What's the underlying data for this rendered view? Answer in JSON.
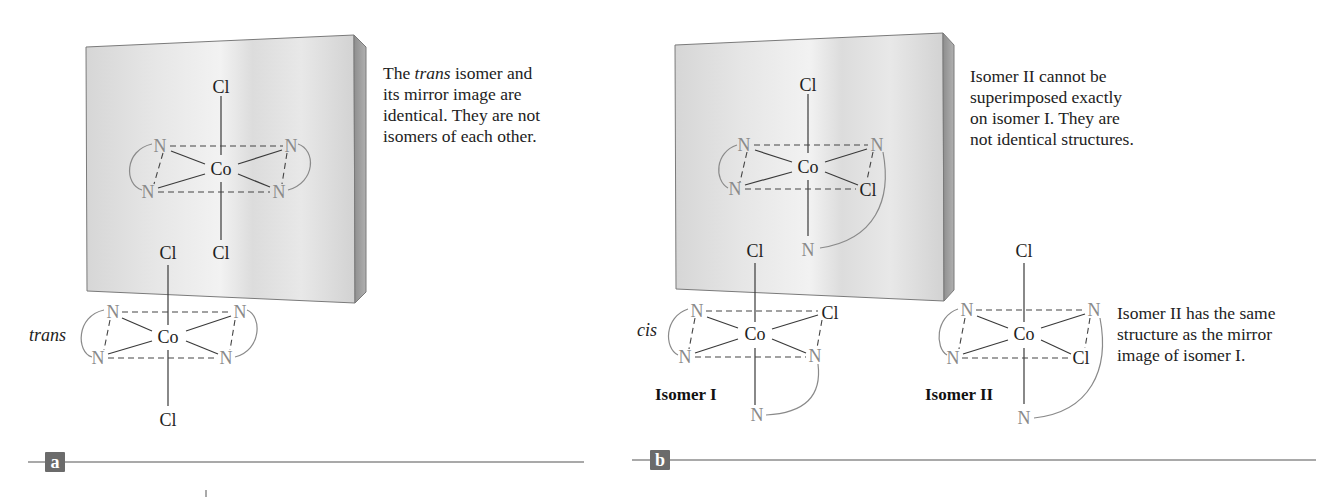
{
  "figure": {
    "panels": [
      {
        "id": "a",
        "label": "a",
        "caption_parts": [
          "The ",
          "trans",
          " isomer and its mirror image are identical. They are not isomers of each other."
        ],
        "caption_lines": [
          [
            "The ",
            "trans",
            " isomer and"
          ],
          [
            "its mirror image are"
          ],
          [
            "identical. They are not"
          ],
          [
            "isomers of each other."
          ]
        ],
        "isomer_tag": "trans",
        "molecule_atoms": {
          "metal": "Co",
          "axial_top": "Cl",
          "axial_bottom": "Cl",
          "equatorial": [
            "N",
            "N",
            "N",
            "N"
          ]
        }
      },
      {
        "id": "b",
        "label": "b",
        "caption_lines": [
          "Isomer II cannot be",
          "superimposed exactly",
          "on isomer I. They are",
          "not identical structures."
        ],
        "caption2_lines": [
          "Isomer II has the same",
          "structure as the mirror",
          "image of isomer I."
        ],
        "isomer_tag": "cis",
        "isomer_names": [
          "Isomer I",
          "Isomer II"
        ],
        "molecule_atoms": {
          "metal": "Co",
          "chloride": "Cl",
          "nitrogen": "N"
        }
      }
    ],
    "atoms": {
      "Co": "Co",
      "Cl": "Cl",
      "N": "N"
    },
    "colors": {
      "mirror_face_light": "#ececec",
      "mirror_face_dark": "#cfcfcf",
      "mirror_side": "#9c9c9c",
      "nitrogen": "#8a8a8a",
      "label_box": "#6b6b6b",
      "rule": "#a9a9a9"
    }
  }
}
